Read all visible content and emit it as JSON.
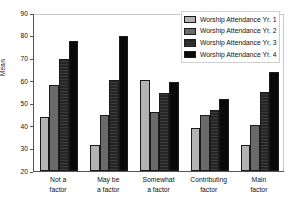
{
  "chart_data": {
    "type": "bar",
    "title": "",
    "subtitle": "",
    "xlabel": "",
    "ylabel": "Mean",
    "ylim": [
      20,
      90
    ],
    "yticks": [
      20,
      30,
      40,
      50,
      60,
      70,
      80,
      90
    ],
    "ytick_labels": [
      "20",
      "30",
      "40",
      "50",
      "60",
      "70",
      "80",
      "90"
    ],
    "grid": false,
    "legend_position": "top-right",
    "categories": [
      "Not a factor",
      "May be a factor",
      "Somewhat a factor",
      "Contributing factor",
      "Main factor"
    ],
    "category_lines": [
      [
        "Not a",
        "factor"
      ],
      [
        "May be",
        "a factor"
      ],
      [
        "Somewhat",
        "a factor"
      ],
      [
        "Contributing",
        "factor"
      ],
      [
        "Main",
        "factor"
      ]
    ],
    "series": [
      {
        "name": "Worship Attendance Yr. 1",
        "color": "#b3b3b3",
        "values": [
          44.0,
          31.5,
          60.5,
          39.0,
          31.5
        ]
      },
      {
        "name": "Worship Attendance Yr. 2",
        "color": "#6a6a6a",
        "values": [
          58.0,
          45.0,
          46.0,
          45.0,
          40.5
        ]
      },
      {
        "name": "Worship Attendance Yr. 3",
        "color": "#262626",
        "values": [
          69.5,
          60.5,
          54.5,
          47.0,
          55.0
        ]
      },
      {
        "name": "Worship Attendance Yr. 4",
        "color": "#090909",
        "values": [
          77.5,
          80.0,
          59.5,
          52.0,
          64.0
        ]
      }
    ]
  },
  "legend": {
    "entries": [
      "Worship Attendance Yr. 1",
      "Worship Attendance Yr. 2",
      "Worship Attendance Yr. 3",
      "Worship Attendance Yr. 4"
    ]
  }
}
